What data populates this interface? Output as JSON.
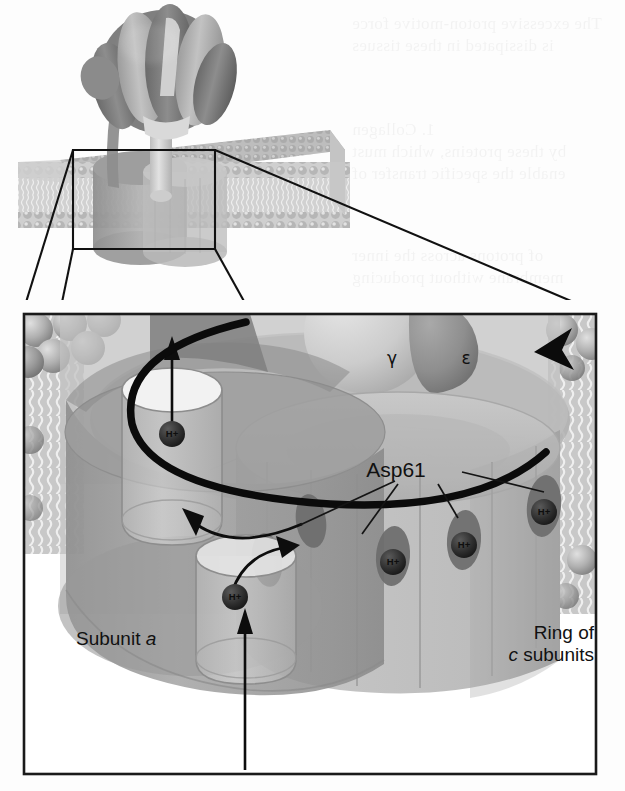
{
  "figure": {
    "title_visible": false,
    "domain": "scientific-diagram",
    "overview": {
      "name": "whole-enzyme-overview",
      "parts": [
        {
          "name": "f1-head",
          "description": "alpha/beta hexamer knob"
        },
        {
          "name": "b-subunit-stalk",
          "description": "peripheral stalk"
        },
        {
          "name": "gamma-stalk",
          "description": "central stalk"
        },
        {
          "name": "lipid-bilayer",
          "description": "membrane slab"
        },
        {
          "name": "fo-rotor",
          "description": "c-ring cylinder in membrane"
        }
      ],
      "inset_box": {
        "name": "magnification-box"
      }
    },
    "detail_panel": {
      "name": "magnified-detail-panel",
      "labels": {
        "asp61": "Asp61",
        "gamma": "γ",
        "epsilon": "ε",
        "subunit_a_prefix": "Subunit ",
        "subunit_a_italic": "a",
        "ring_line1": "Ring of",
        "ring_line2_italic": "c",
        "ring_line2_rest": " subunits"
      },
      "proton_label": "H+",
      "protons": [
        {
          "name": "proton-in-upper-half-channel",
          "x": 172,
          "y": 434
        },
        {
          "name": "proton-in-lower-half-channel",
          "x": 235,
          "y": 597
        },
        {
          "name": "proton-at-asp61-site-1",
          "x": 393,
          "y": 562
        },
        {
          "name": "proton-at-asp61-site-2",
          "x": 464,
          "y": 545
        },
        {
          "name": "proton-at-asp61-site-3",
          "x": 544,
          "y": 512
        }
      ],
      "asp61_sites": [
        {
          "name": "asp61-site-left-a",
          "cx": 311,
          "cy": 521,
          "rx": 15,
          "ry": 27,
          "rot": -8
        },
        {
          "name": "asp61-site-left-b",
          "cx": 267,
          "cy": 560,
          "rx": 15,
          "ry": 27,
          "rot": -8
        },
        {
          "name": "asp61-site-1",
          "cx": 393,
          "cy": 556,
          "rx": 17,
          "ry": 30,
          "rot": 4
        },
        {
          "name": "asp61-site-2",
          "cx": 464,
          "cy": 540,
          "rx": 17,
          "ry": 30,
          "rot": 4
        },
        {
          "name": "asp61-site-3",
          "cx": 544,
          "cy": 506,
          "rx": 17,
          "ry": 31,
          "rot": 6
        }
      ],
      "arrows": [
        {
          "name": "proton-exit-arrow-up",
          "type": "straight-up"
        },
        {
          "name": "proton-entry-arrow-up",
          "type": "straight-up"
        },
        {
          "name": "proton-hop-in-arrow",
          "type": "curved"
        },
        {
          "name": "proton-hop-out-arrow",
          "type": "curved"
        },
        {
          "name": "rotation-arrow",
          "type": "ellipse-sweep"
        }
      ]
    },
    "colors": {
      "line": "#111111",
      "panel_border": "#1a1a1a",
      "subunit_a": "#9a9a9a",
      "c_ring": "#b9b9b9",
      "asp_site": "#6d6d6d",
      "asp_core": "#3b3b3b",
      "membrane_head": "#a8a8a8",
      "f1_dark": "#7d7d7d",
      "f1_light": "#b5b5b5",
      "gamma_light": "#cfcfcf",
      "background": "#fdfdfd"
    },
    "background_showthrough": [
      {
        "text": "The excessive proton-motive force",
        "x": 352,
        "y": 14
      },
      {
        "text": "is dissipated in these tissues",
        "x": 352,
        "y": 36
      },
      {
        "text": "1. Collagen",
        "x": 352,
        "y": 120
      },
      {
        "text": "by these proteins, which must",
        "x": 352,
        "y": 142
      },
      {
        "text": "enable the specific transfer of",
        "x": 352,
        "y": 164
      },
      {
        "text": "of protons across the inner",
        "x": 352,
        "y": 246
      },
      {
        "text": "membrane without producing",
        "x": 352,
        "y": 268
      },
      {
        "text": "the proton gradient has many",
        "x": 352,
        "y": 356
      },
      {
        "text": "transmembrane segments",
        "x": 352,
        "y": 378
      },
      {
        "text": "contains a small number",
        "x": 352,
        "y": 672
      },
      {
        "text": "of residues that are",
        "x": 352,
        "y": 694
      },
      {
        "text": "essential for the transfer",
        "x": 352,
        "y": 716
      },
      {
        "text": "of protons through the",
        "x": 352,
        "y": 738
      },
      {
        "text": "membrane in both",
        "x": 352,
        "y": 760
      }
    ]
  }
}
